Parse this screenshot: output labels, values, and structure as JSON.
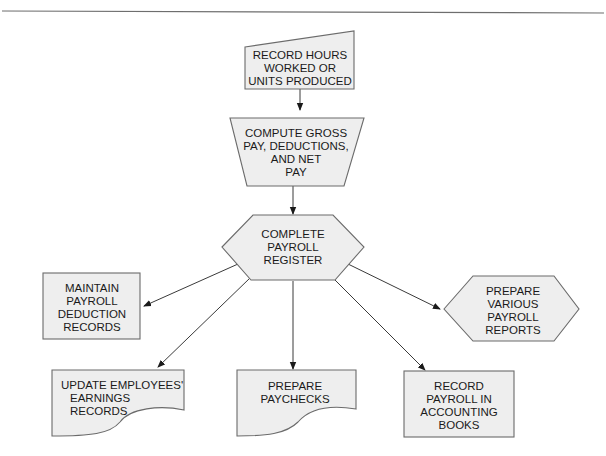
{
  "diagram": {
    "nodes": {
      "record_hours": {
        "shape": "manual-input",
        "lines": [
          "RECORD HOURS",
          "WORKED OR",
          "UNITS PRODUCED"
        ]
      },
      "compute_pay": {
        "shape": "manual-operation",
        "lines": [
          "COMPUTE GROSS",
          "PAY, DEDUCTIONS,",
          "AND NET",
          "PAY"
        ]
      },
      "complete_register": {
        "shape": "preparation-hexagon",
        "lines": [
          "COMPLETE",
          "PAYROLL",
          "REGISTER"
        ]
      },
      "maintain_deduction": {
        "shape": "process-rectangle",
        "lines": [
          "MAINTAIN",
          "PAYROLL",
          "DEDUCTION",
          "RECORDS"
        ]
      },
      "prepare_reports": {
        "shape": "preparation-hexagon",
        "lines": [
          "PREPARE",
          "VARIOUS",
          "PAYROLL",
          "REPORTS"
        ]
      },
      "update_earnings": {
        "shape": "document",
        "lines": [
          "UPDATE EMPLOYEES'",
          "EARNINGS",
          "RECORDS"
        ]
      },
      "prepare_paychecks": {
        "shape": "document",
        "lines": [
          "PREPARE",
          "PAYCHECKS"
        ]
      },
      "record_books": {
        "shape": "process-rectangle",
        "lines": [
          "RECORD",
          "PAYROLL IN",
          "ACCOUNTING",
          "BOOKS"
        ]
      }
    },
    "edges": [
      {
        "from": "record_hours",
        "to": "compute_pay"
      },
      {
        "from": "compute_pay",
        "to": "complete_register"
      },
      {
        "from": "complete_register",
        "to": "maintain_deduction"
      },
      {
        "from": "complete_register",
        "to": "update_earnings"
      },
      {
        "from": "complete_register",
        "to": "prepare_paychecks"
      },
      {
        "from": "complete_register",
        "to": "record_books"
      },
      {
        "from": "complete_register",
        "to": "prepare_reports"
      }
    ],
    "colors": {
      "shape_fill": "#eeeeee",
      "shape_stroke": "#6b6b6b",
      "edge": "#3a3a3a",
      "text": "#1a1a1a"
    }
  }
}
